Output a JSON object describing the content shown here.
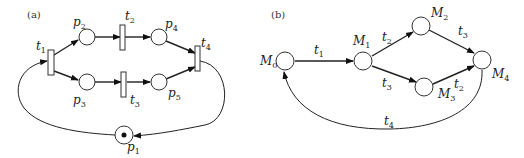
{
  "panel_a": {
    "label": "(a)",
    "title": "Petri net",
    "places": [
      {
        "id": "p1",
        "name": "p",
        "sub": "1",
        "tokens": 1
      },
      {
        "id": "p2",
        "name": "p",
        "sub": "2",
        "tokens": 0
      },
      {
        "id": "p3",
        "name": "p",
        "sub": "3",
        "tokens": 0
      },
      {
        "id": "p4",
        "name": "p",
        "sub": "4",
        "tokens": 0
      },
      {
        "id": "p5",
        "name": "p",
        "sub": "5",
        "tokens": 0
      }
    ],
    "transitions": [
      {
        "id": "t1",
        "name": "t",
        "sub": "1"
      },
      {
        "id": "t2",
        "name": "t",
        "sub": "2"
      },
      {
        "id": "t3",
        "name": "t",
        "sub": "3"
      },
      {
        "id": "t4",
        "name": "t",
        "sub": "4"
      }
    ],
    "arcs": [
      [
        "p1",
        "t1"
      ],
      [
        "t1",
        "p2"
      ],
      [
        "t1",
        "p3"
      ],
      [
        "p2",
        "t2"
      ],
      [
        "p3",
        "t3"
      ],
      [
        "t2",
        "p4"
      ],
      [
        "t3",
        "p5"
      ],
      [
        "p4",
        "t4"
      ],
      [
        "p5",
        "t4"
      ],
      [
        "t4",
        "p1"
      ]
    ]
  },
  "panel_b": {
    "label": "(b)",
    "title": "Reachability graph",
    "markings": [
      {
        "id": "M0",
        "name": "M",
        "sub": "0"
      },
      {
        "id": "M1",
        "name": "M",
        "sub": "1"
      },
      {
        "id": "M2",
        "name": "M",
        "sub": "2"
      },
      {
        "id": "M3",
        "name": "M",
        "sub": "3"
      },
      {
        "id": "M4",
        "name": "M",
        "sub": "4"
      }
    ],
    "edges": [
      {
        "from": "M0",
        "to": "M1",
        "name": "t",
        "sub": "1"
      },
      {
        "from": "M1",
        "to": "M2",
        "name": "t",
        "sub": "2"
      },
      {
        "from": "M1",
        "to": "M3",
        "name": "t",
        "sub": "3"
      },
      {
        "from": "M2",
        "to": "M4",
        "name": "t",
        "sub": "3"
      },
      {
        "from": "M3",
        "to": "M4",
        "name": "t",
        "sub": "2"
      },
      {
        "from": "M4",
        "to": "M0",
        "name": "t",
        "sub": "4"
      }
    ]
  }
}
